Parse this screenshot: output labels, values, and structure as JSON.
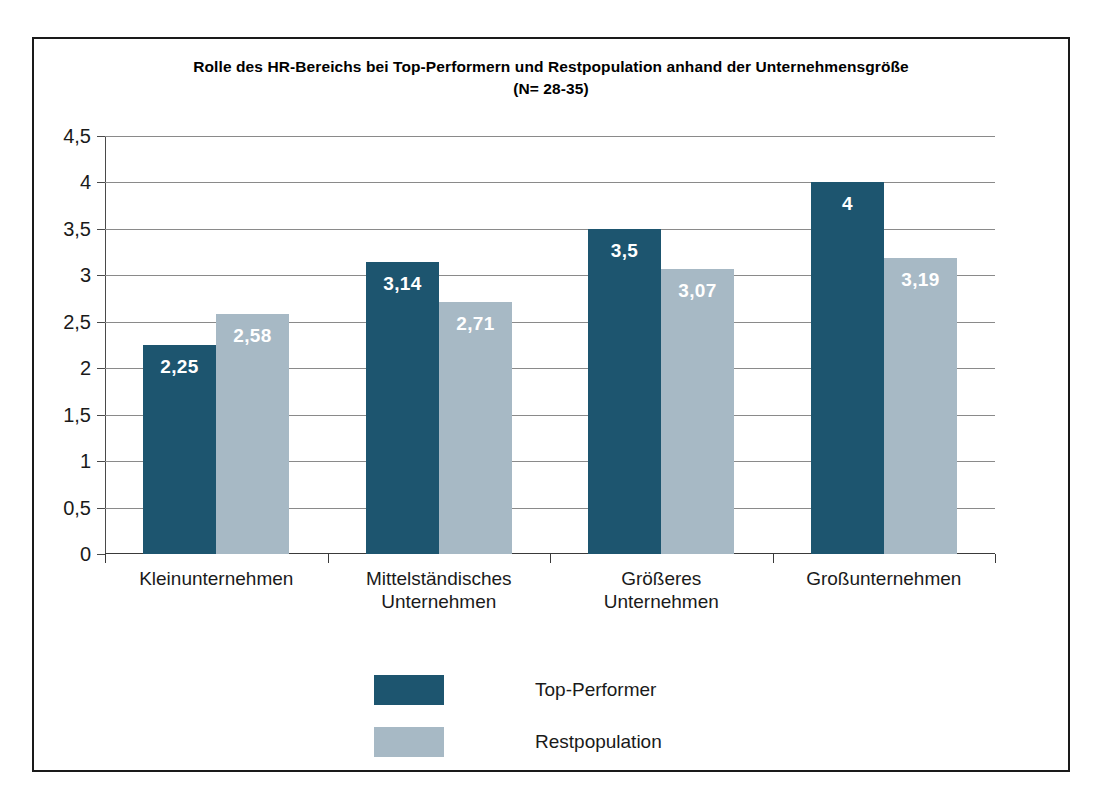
{
  "chart_data": {
    "type": "bar",
    "title": "Rolle des HR-Bereichs bei Top-Performern und Restpopulation anhand der Unternehmensgröße",
    "subtitle": "(N= 28-35)",
    "xlabel": "",
    "ylabel": "",
    "ylim": [
      0,
      4.5
    ],
    "grid": true,
    "legend_position": "bottom",
    "categories": [
      "Kleinunternehmen",
      "Mittelständisches Unternehmen",
      "Größeres Unternehmen",
      "Großunternehmen"
    ],
    "category_lines": [
      [
        "Kleinunternehmen"
      ],
      [
        "Mittelständisches",
        "Unternehmen"
      ],
      [
        "Größeres",
        "Unternehmen"
      ],
      [
        "Großunternehmen"
      ]
    ],
    "ytick_labels": [
      "4,5",
      "4",
      "3,5",
      "3",
      "2,5",
      "2",
      "1,5",
      "1",
      "0,5",
      "0"
    ],
    "ytick_values": [
      4.5,
      4,
      3.5,
      3,
      2.5,
      2,
      1.5,
      1,
      0.5,
      0
    ],
    "series": [
      {
        "name": "Top-Performer",
        "color": "#1d556f",
        "values": [
          2.25,
          3.14,
          3.5,
          4
        ],
        "labels": [
          "2,25",
          "3,14",
          "3,5",
          "4"
        ]
      },
      {
        "name": "Restpopulation",
        "color": "#a7b9c5",
        "values": [
          2.58,
          2.71,
          3.07,
          3.19
        ],
        "labels": [
          "2,58",
          "2,71",
          "3,07",
          "3,19"
        ]
      }
    ]
  }
}
